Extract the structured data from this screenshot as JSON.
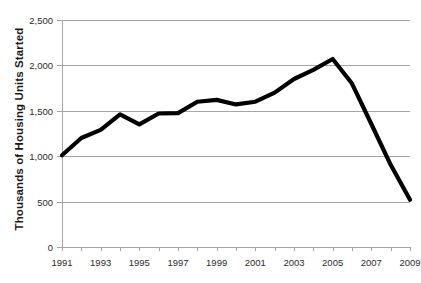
{
  "chart_data": {
    "type": "line",
    "title": "",
    "xlabel": "",
    "ylabel": "Thousands of Housing Units Started",
    "x": [
      1991,
      1992,
      1993,
      1994,
      1995,
      1996,
      1997,
      1998,
      1999,
      2000,
      2001,
      2002,
      2003,
      2004,
      2005,
      2006,
      2007,
      2008,
      2009
    ],
    "values": [
      1010,
      1200,
      1290,
      1460,
      1350,
      1470,
      1475,
      1600,
      1620,
      1570,
      1600,
      1700,
      1850,
      1950,
      2070,
      1800,
      1355,
      905,
      520
    ],
    "series": [
      {
        "name": "Housing Units Started",
        "values": [
          1010,
          1200,
          1290,
          1460,
          1350,
          1470,
          1475,
          1600,
          1620,
          1570,
          1600,
          1700,
          1850,
          1950,
          2070,
          1800,
          1355,
          905,
          520
        ]
      }
    ],
    "xlim": [
      1991,
      2009
    ],
    "ylim": [
      0,
      2500
    ],
    "y_ticks": [
      0,
      500,
      1000,
      1500,
      2000,
      2500
    ],
    "y_tick_labels": [
      "0",
      "500",
      "1,000",
      "1,500",
      "2,000",
      "2,500"
    ],
    "x_ticks": [
      1991,
      1992,
      1993,
      1994,
      1995,
      1996,
      1997,
      1998,
      1999,
      2000,
      2001,
      2002,
      2003,
      2004,
      2005,
      2006,
      2007,
      2008,
      2009
    ],
    "x_tick_labels_shown": [
      "1991",
      "1993",
      "1995",
      "1997",
      "1999",
      "2001",
      "2003",
      "2005",
      "2007",
      "2009"
    ],
    "grid": true,
    "legend": false,
    "line_color": "#000000",
    "grid_color": "#a6a6a6"
  }
}
